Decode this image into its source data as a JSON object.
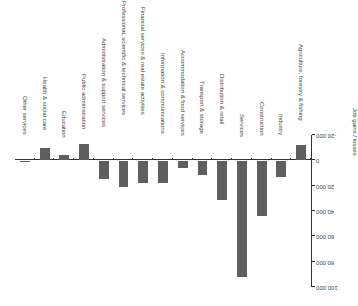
{
  "chart_data": {
    "type": "bar",
    "title": "",
    "xlabel": "",
    "ylabel": "Job gains / losses",
    "ylim": [
      -20000,
      100000
    ],
    "yticks": [
      -20000,
      0,
      20000,
      40000,
      60000,
      80000,
      100000
    ],
    "ytick_labels": [
      "-20,000",
      "0",
      "20,000",
      "40,000",
      "60,000",
      "80,000",
      "100,000"
    ],
    "grid": false,
    "legend": null,
    "orientation_note": "rendered rotated 180 degrees",
    "categories": [
      "Agriculture, forestry & fishing",
      "Industry",
      "Construction",
      "Services",
      "Distribution & retail",
      "Transport & storage",
      "Accommodation & food services",
      "Information & communications",
      "Financial services & real estate activities",
      "Professional, scientific & technical services",
      "Administration & support services",
      "Public administration",
      "Education",
      "Health & social care",
      "Other services"
    ],
    "values": [
      -12000,
      13000,
      44000,
      92000,
      31000,
      11500,
      6000,
      18000,
      18000,
      21000,
      15000,
      -13000,
      -4500,
      -10000,
      1500
    ],
    "bar_color": "#5f5f5f"
  }
}
